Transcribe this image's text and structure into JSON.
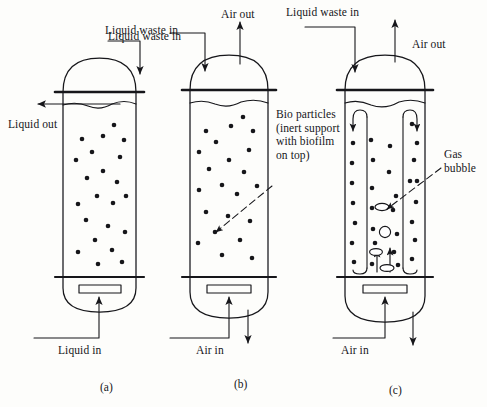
{
  "figure": {
    "kind": "schematic-diagram",
    "background_color": "#fdfdfb",
    "ink_color": "#16161a",
    "panel_count": 3
  },
  "panels": [
    {
      "letter": "(a)",
      "name": "liquid-fluidized-bed",
      "labels": {
        "inlet_top": "Liquid waste in",
        "outlet_side": "Liquid out",
        "inlet_bottom": "Liquid in"
      },
      "bio_particle_count": 22
    },
    {
      "letter": "(b)",
      "name": "air-fluidized-bed",
      "labels": {
        "inlet_top": "Liquid waste in",
        "outlet_top": "Air out",
        "inlet_bottom": "Air in"
      },
      "bio_particle_count": 22
    },
    {
      "letter": "(c)",
      "name": "airlift-draft-tube-reactor",
      "labels": {
        "inlet_top": "Liquid waste in",
        "outlet_top": "Air out",
        "inlet_bottom": "Air in"
      },
      "bio_particle_count": 30,
      "gas_bubble_count": 4,
      "has_draft_tube": true
    }
  ],
  "annotations": {
    "bio_particles": "Bio particles\n(inert support\nwith biofilm\non top)",
    "gas_bubble": "Gas\nbubble"
  },
  "icons": {
    "arrow": "arrow-head-icon",
    "particle": "bio-particle-dot-icon",
    "bubble": "gas-bubble-ellipse-icon",
    "distributor": "distributor-plate-icon"
  }
}
